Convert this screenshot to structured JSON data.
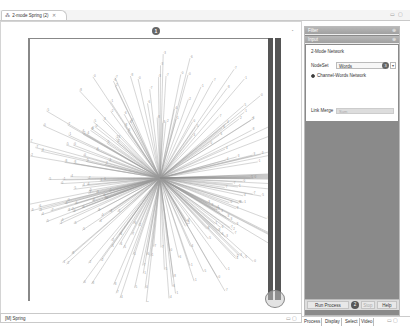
{
  "editor": {
    "tab_icon": "network-icon",
    "tab_title": "2-mode Spring (2)",
    "tab_close": "✕",
    "window_controls": "▭ ▢",
    "badge_number": "1"
  },
  "status_tab": {
    "label": "[M] Spring",
    "controls": "▭ ▢"
  },
  "panel": {
    "filter_header": "Filter",
    "input_header": "Input",
    "pin": "⊕",
    "network_type": "2-Mode Network",
    "nodeset_label": "NodeSet",
    "nodeset_value": "Words",
    "nodeset_badge": "3",
    "nodeset_arrow": "▾",
    "radio_label": "Channel-Words Network",
    "link_merge_label": "Link Merge",
    "link_merge_value": "Sum",
    "buttons": {
      "run": "Run Process",
      "run_badge": "2",
      "stop": "Stop",
      "help": "Help"
    },
    "bottom_tabs": [
      "Process",
      "Display",
      "Select",
      "Video"
    ],
    "bottom_controls": "▭ ▢"
  },
  "graph": {
    "center": [
      132,
      140
    ],
    "node_color": "#999999",
    "edge_color": "#9a9a9a"
  }
}
